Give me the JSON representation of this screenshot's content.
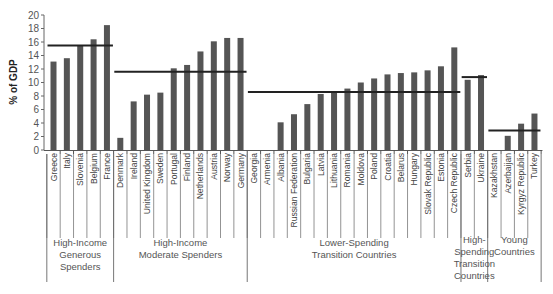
{
  "chart_data": {
    "type": "bar",
    "title": "",
    "xlabel": "",
    "ylabel": "% of GDP",
    "ylim": [
      0,
      20
    ],
    "yticks": [
      0,
      2,
      4,
      6,
      8,
      10,
      12,
      14,
      16,
      18,
      20
    ],
    "grid": false,
    "legend": null,
    "bar_color": "#555555",
    "average_line_color": "#222222",
    "groups": [
      {
        "name": "High-Income Generous Spenders",
        "label_lines": [
          "High-Income",
          "Generous",
          "Spenders"
        ],
        "average": 15.5,
        "categories": [
          "Greece",
          "Italy",
          "Slovenia",
          "Belgium",
          "France"
        ],
        "values": [
          13.1,
          13.6,
          15.5,
          16.4,
          18.5
        ]
      },
      {
        "name": "High-Income Moderate Spenders",
        "label_lines": [
          "High-Income",
          "Moderate Spenders"
        ],
        "average": 11.6,
        "categories": [
          "Denmark",
          "Ireland",
          "United Kingdom",
          "Sweden",
          "Portugal",
          "Finland",
          "Netherlands",
          "Austria",
          "Norway",
          "Germany"
        ],
        "values": [
          1.8,
          7.2,
          8.2,
          8.5,
          12.1,
          12.6,
          14.6,
          16.1,
          16.6,
          16.6
        ]
      },
      {
        "name": "Lower-Spending Transition Countries",
        "label_lines": [
          "Lower-Spending",
          "Transition Countries"
        ],
        "average": 8.6,
        "categories": [
          "Georgia",
          "Armenia",
          "Albania",
          "Russian Federation",
          "Bulgaria",
          "Latvia",
          "Lithuania",
          "Romania",
          "Moldova",
          "Poland",
          "Croatia",
          "Belarus",
          "Hungary",
          "Slovak Republic",
          "Estonia",
          "Czech Republic"
        ],
        "values": [
          0,
          0,
          4.1,
          5.3,
          6.8,
          8.3,
          8.5,
          9.1,
          10.0,
          10.6,
          11.2,
          11.4,
          11.5,
          11.8,
          12.4,
          15.2
        ]
      },
      {
        "name": "High-Spending Transition Countries",
        "label_lines": [
          "High-",
          "Spending",
          "Transition",
          "Countries"
        ],
        "average": 10.8,
        "categories": [
          "Serbia",
          "Ukraine"
        ],
        "values": [
          10.4,
          11.1
        ]
      },
      {
        "name": "Young Countries",
        "label_lines": [
          "Young",
          "Countries"
        ],
        "average": 2.9,
        "categories": [
          "Kazakhstan",
          "Azerbaijan",
          "Kyrgyz Republic",
          "Turkey"
        ],
        "values": [
          0,
          2.1,
          3.9,
          5.4
        ]
      }
    ]
  }
}
